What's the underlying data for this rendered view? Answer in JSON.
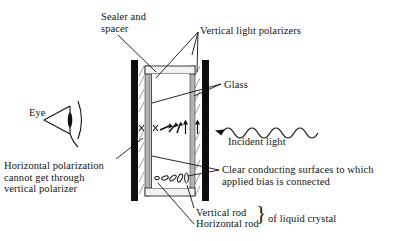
{
  "figure": {
    "background_color": "#ffffff",
    "ink_color": "#141414"
  },
  "labels": {
    "sealer": "Sealer and\nspacer",
    "vertical_polarizers": "Vertical light polarizers",
    "glass": "Glass",
    "eye": "Eye",
    "incident_light": "Incident light",
    "horizontal_polarization": "Horizontal polarization\ncannot get through\nvertical polarizer",
    "clear_conducting": "Clear conducting surfaces to which\napplied bias is connected",
    "vertical_rod": "Vertical rod",
    "horizontal_rod": "Horizontal rod",
    "of_liquid_crystal": "of liquid crystal",
    "brace": "}"
  },
  "diagram": {
    "polarizer_color": "#0d0d0d",
    "glass_color": "#b3b3b3",
    "cell_fill": "#ffffff",
    "sealer_color": "#e8e8e8",
    "polarizer_left_x": 131,
    "polarizer_right_x": 203,
    "cell_top_y": 60,
    "cell_bottom_y": 201,
    "rod_row_upper_y": 128,
    "rod_row_lower_y": 178,
    "x_marks": [
      "x",
      "x"
    ],
    "twist_arrow_count": 5,
    "rod_ellipse_count": 5,
    "wave_periods": 7,
    "wave_amplitude": 5
  }
}
